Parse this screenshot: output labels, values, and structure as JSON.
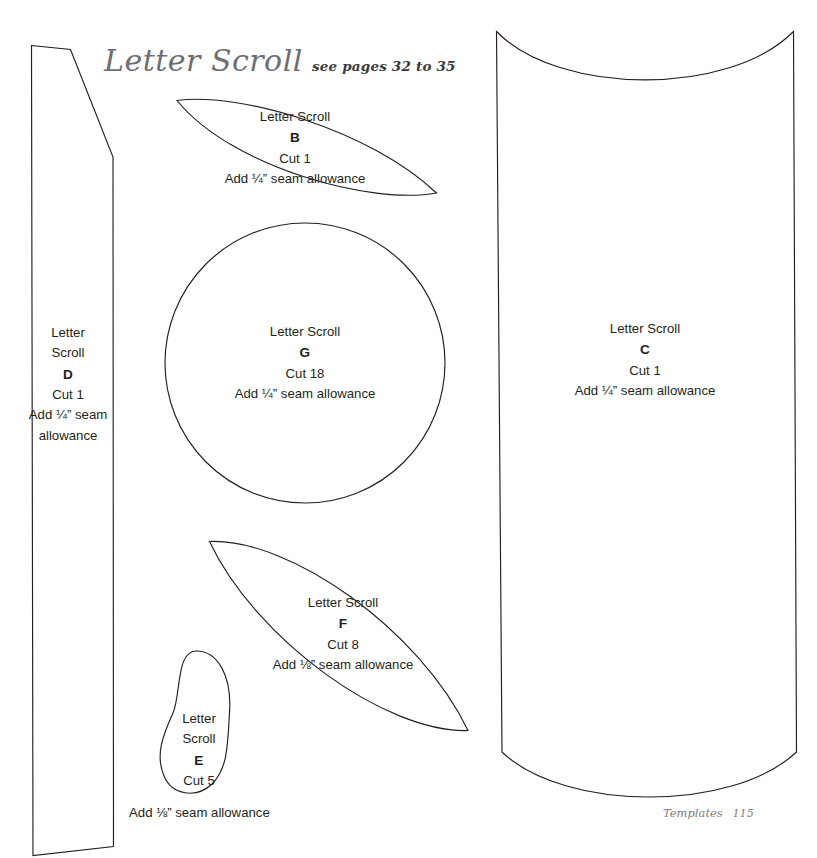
{
  "page": {
    "title": "Letter Scroll",
    "subtitle": "see pages 32 to 35",
    "width": 817,
    "height": 858,
    "background_color": "#ffffff",
    "line_color": "#231f20",
    "title_color": "#6e6e72"
  },
  "footer": {
    "section": "Templates",
    "page_number": "115"
  },
  "pieces": [
    {
      "id": "B",
      "shape": "pointed-oval-leaf",
      "name_line": "Letter Scroll",
      "letter": "B",
      "cut": "Cut 1",
      "seam": "Add ¼” seam allowance"
    },
    {
      "id": "G",
      "shape": "circle",
      "name_line": "Letter Scroll",
      "letter": "G",
      "cut": "Cut 18",
      "seam": "Add ¼” seam allowance"
    },
    {
      "id": "C",
      "shape": "tall-curved-rectangle",
      "name_line": "Letter Scroll",
      "letter": "C",
      "cut": "Cut 1",
      "seam": "Add ¼” seam allowance"
    },
    {
      "id": "D",
      "shape": "tall-angled-strip",
      "name_word_1": "Letter",
      "name_word_2": "Scroll",
      "letter": "D",
      "cut": "Cut 1",
      "seam_line_1": "Add ¼” seam",
      "seam_line_2": "allowance"
    },
    {
      "id": "F",
      "shape": "pointed-oval-leaf",
      "name_line": "Letter Scroll",
      "letter": "F",
      "cut": "Cut 8",
      "seam": "Add ⅛” seam allowance"
    },
    {
      "id": "E",
      "shape": "teardrop",
      "name_word_1": "Letter",
      "name_word_2": "Scroll",
      "letter": "E",
      "cut": "Cut 5",
      "seam_external": "Add ⅛” seam allowance"
    }
  ]
}
